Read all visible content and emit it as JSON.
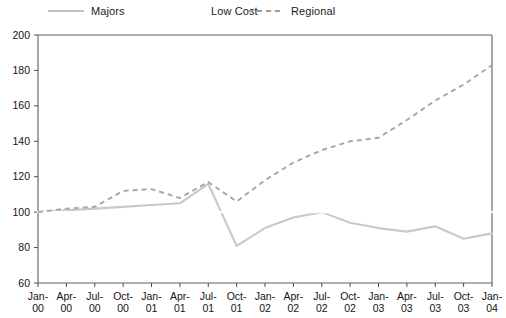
{
  "legend": {
    "position": "top",
    "entries": [
      {
        "label": "Majors",
        "style": "solid",
        "color": "#c9c9c9",
        "icon": "line-solid-icon"
      },
      {
        "label": "Low Cost",
        "style": "solid",
        "color": "#ffffff",
        "icon": "line-solid-icon"
      },
      {
        "label": "Regional",
        "style": "dashed",
        "color": "#a6a6a6",
        "icon": "line-dashed-icon"
      }
    ]
  },
  "chart_data": {
    "type": "line",
    "title": "",
    "subtitle": "",
    "xlabel": "",
    "ylabel": "",
    "grid": false,
    "legend_position": "top",
    "ylim": [
      60,
      200
    ],
    "y_ticks": [
      60,
      80,
      100,
      120,
      140,
      160,
      180,
      200
    ],
    "categories": [
      "Jan-00",
      "Apr-00",
      "Jul-00",
      "Oct-00",
      "Jan-01",
      "Apr-01",
      "Jul-01",
      "Oct-01",
      "Jan-02",
      "Apr-02",
      "Jul-02",
      "Oct-02",
      "Jan-03",
      "Apr-03",
      "Jul-03",
      "Oct-03",
      "Jan-04"
    ],
    "series": [
      {
        "name": "Majors",
        "style": "solid",
        "color": "#c9c9c9",
        "values": [
          100,
          101,
          102,
          103,
          104,
          105,
          116,
          81,
          91,
          97,
          100,
          94,
          91,
          89,
          92,
          85,
          88
        ]
      },
      {
        "name": "Low Cost",
        "style": "solid",
        "color": "#ffffff",
        "values": [
          100,
          100,
          100,
          100,
          100,
          100,
          100,
          100,
          100,
          100,
          100,
          100,
          100,
          100,
          100,
          100,
          100
        ]
      },
      {
        "name": "Regional",
        "style": "dashed",
        "color": "#a6a6a6",
        "values": [
          100,
          102,
          103,
          112,
          113,
          108,
          117,
          106,
          118,
          128,
          135,
          140,
          142,
          152,
          163,
          172,
          183
        ]
      }
    ]
  }
}
